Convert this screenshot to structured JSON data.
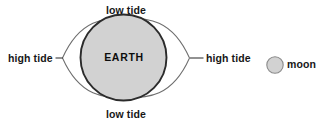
{
  "diagram": {
    "canvas": {
      "width": 331,
      "height": 124,
      "background": "#ffffff"
    },
    "labels": {
      "low_tide_top": "low tide",
      "low_tide_bottom": "low tide",
      "high_tide_left": "high tide",
      "high_tide_right": "high tide",
      "earth": "EARTH",
      "moon": "moon"
    },
    "colors": {
      "earth_fill": "#d2d2d2",
      "earth_stroke": "#2b2b2b",
      "bulge_stroke": "#6e6e6e",
      "bulge_fill": "#ffffff",
      "moon_fill": "#d2d2d2",
      "moon_stroke": "#8a8a8a",
      "text": "#171717",
      "leader_line": "#3a3a3a"
    },
    "shapes": {
      "earth": {
        "cx": 123.5,
        "cy": 57.5,
        "r": 43.5
      },
      "bulge": {
        "cx": 126,
        "cy": 58,
        "left_vertex_x": 62,
        "right_vertex_x": 190,
        "top_y": 18,
        "bottom_y": 98
      },
      "moon": {
        "cx": 275,
        "cy": 65,
        "r": 8.5
      },
      "leader_left": {
        "x1": 56,
        "y1": 58,
        "x2": 63,
        "y2": 58
      },
      "leader_right": {
        "x1": 190,
        "y1": 58,
        "x2": 203,
        "y2": 58
      }
    }
  }
}
